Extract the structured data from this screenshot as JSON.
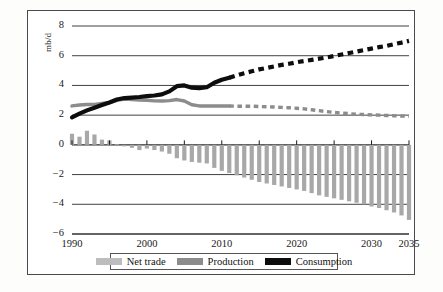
{
  "chart_data": {
    "type": "bar",
    "title": "",
    "xlabel": "",
    "ylabel": "mb/d",
    "ylim": [
      -6,
      8
    ],
    "xlim": [
      1990,
      2035
    ],
    "grid": true,
    "y_ticks": [
      8,
      6,
      4,
      2,
      0,
      -2,
      -4,
      -6
    ],
    "y_tick_labels": [
      "8",
      "6",
      "4",
      "2",
      "0",
      "−2",
      "−4",
      "−6"
    ],
    "x_ticks": [
      1990,
      2000,
      2010,
      2020,
      2030,
      2035
    ],
    "x_tick_labels": [
      "1990",
      "2000",
      "2010",
      "2020",
      "2030",
      "2035"
    ],
    "history_end_year": 2011,
    "legend_position": "below-axes",
    "categories": [
      1990,
      1991,
      1992,
      1993,
      1994,
      1995,
      1996,
      1997,
      1998,
      1999,
      2000,
      2001,
      2002,
      2003,
      2004,
      2005,
      2006,
      2007,
      2008,
      2009,
      2010,
      2011,
      2012,
      2013,
      2014,
      2015,
      2016,
      2017,
      2018,
      2019,
      2020,
      2021,
      2022,
      2023,
      2024,
      2025,
      2026,
      2027,
      2028,
      2029,
      2030,
      2031,
      2032,
      2033,
      2034,
      2035
    ],
    "series": [
      {
        "name": "Net trade",
        "type": "bar",
        "color": "#a8a8a8",
        "values": [
          0.75,
          0.55,
          0.95,
          0.7,
          0.35,
          0.3,
          0.05,
          -0.1,
          -0.2,
          -0.35,
          -0.25,
          -0.35,
          -0.45,
          -0.6,
          -0.9,
          -1.05,
          -1.15,
          -1.2,
          -1.25,
          -1.55,
          -1.75,
          -1.9,
          -2.05,
          -2.2,
          -2.35,
          -2.5,
          -2.6,
          -2.7,
          -2.8,
          -2.9,
          -3.0,
          -3.1,
          -3.25,
          -3.4,
          -3.5,
          -3.6,
          -3.7,
          -3.8,
          -3.9,
          -4.0,
          -4.15,
          -4.25,
          -4.4,
          -4.55,
          -4.75,
          -5.05
        ]
      },
      {
        "name": "Production",
        "type": "line",
        "color": "#8c8c8c",
        "values": [
          2.62,
          2.68,
          2.72,
          2.72,
          2.78,
          2.85,
          3.0,
          3.08,
          3.05,
          3.02,
          3.0,
          2.96,
          2.95,
          2.98,
          3.05,
          2.95,
          2.7,
          2.62,
          2.62,
          2.62,
          2.62,
          2.62,
          2.6,
          2.6,
          2.6,
          2.58,
          2.56,
          2.55,
          2.52,
          2.5,
          2.46,
          2.42,
          2.36,
          2.3,
          2.24,
          2.18,
          2.14,
          2.1,
          2.06,
          2.04,
          2.02,
          2.0,
          1.98,
          1.96,
          1.94,
          1.92
        ]
      },
      {
        "name": "Consumption",
        "type": "line",
        "color": "#0d0d0d",
        "values": [
          1.85,
          2.1,
          2.32,
          2.5,
          2.68,
          2.85,
          3.05,
          3.15,
          3.18,
          3.22,
          3.28,
          3.32,
          3.4,
          3.6,
          3.95,
          4.0,
          3.85,
          3.82,
          3.88,
          4.18,
          4.38,
          4.52,
          4.68,
          4.82,
          4.95,
          5.08,
          5.18,
          5.28,
          5.38,
          5.46,
          5.56,
          5.64,
          5.72,
          5.8,
          5.88,
          5.98,
          6.08,
          6.18,
          6.28,
          6.38,
          6.48,
          6.58,
          6.66,
          6.78,
          6.88,
          7.0
        ]
      }
    ]
  },
  "legend": {
    "items": [
      {
        "label": "Net trade",
        "swatch": "net-trade-swatch",
        "color": "#bdbdbd"
      },
      {
        "label": "Production",
        "swatch": "production-swatch",
        "color": "#8c8c8c"
      },
      {
        "label": "Consumption",
        "swatch": "consumption-swatch",
        "color": "#0d0d0d"
      }
    ]
  },
  "axis": {
    "unit_label": "mb/d"
  }
}
